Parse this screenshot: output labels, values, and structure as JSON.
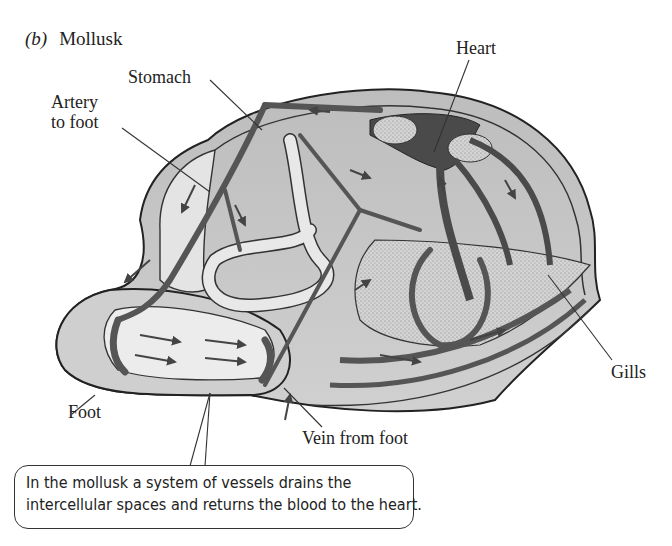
{
  "figure": {
    "panel_letter": "(b)",
    "title": "Mollusk"
  },
  "labels": {
    "stomach": "Stomach",
    "artery_line1": "Artery",
    "artery_line2": "to foot",
    "heart": "Heart",
    "gills": "Gills",
    "foot": "Foot",
    "vein": "Vein from foot"
  },
  "callout": {
    "line1": "In the mollusk a system of vessels drains the",
    "line2": "intercellular spaces and returns the blood to the heart."
  },
  "colors": {
    "body_fill": "#c8c8c8",
    "inner_fill": "#e2e2e2",
    "vessel": "#555555",
    "heart_dark": "#4a4a4a",
    "gill_stipple": "#bdbdbd",
    "outline": "#222222"
  }
}
